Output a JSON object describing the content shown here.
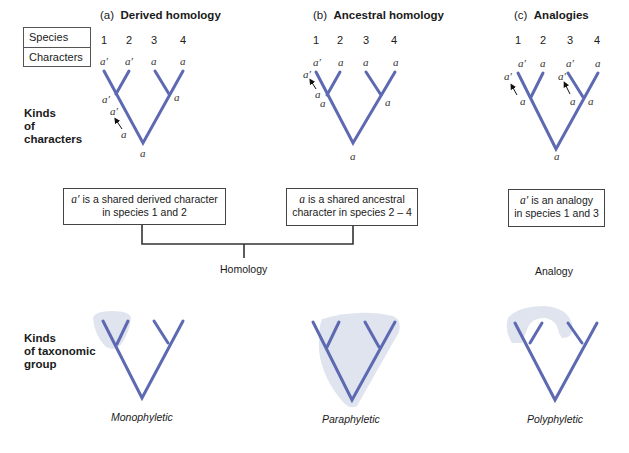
{
  "legend": {
    "species_label": "Species",
    "characters_label": "Characters"
  },
  "panels": [
    {
      "letter": "(a)",
      "title": "Derived homology",
      "species": [
        "1",
        "2",
        "3",
        "4"
      ],
      "leaf_chars": [
        "a′",
        "a′",
        "a",
        "a"
      ],
      "node_labels": {
        "left_node": "a′",
        "branch_upper": "a′",
        "branch_lower": "a",
        "right_node": "a",
        "root": "a"
      }
    },
    {
      "letter": "(b)",
      "title": "Ancestral homology",
      "species": [
        "1",
        "2",
        "3",
        "4"
      ],
      "leaf_chars": [
        "a′",
        "a",
        "a",
        "a"
      ],
      "node_labels": {
        "branch_upper": "a′",
        "branch_lower": "a",
        "left_node": "a",
        "right_node": "a",
        "root": "a"
      }
    },
    {
      "letter": "(c)",
      "title": "Analogies",
      "species": [
        "1",
        "2",
        "3",
        "4"
      ],
      "leaf_chars": [
        "a′",
        "a",
        "a′",
        "a"
      ],
      "node_labels": {
        "branch1_upper": "a′",
        "branch1_lower": "a",
        "branch3_upper": "a′",
        "branch3_lower": "a",
        "right_node": "a",
        "root": "a"
      }
    }
  ],
  "row_labels": {
    "characters": [
      "Kinds",
      "of",
      "characters"
    ],
    "taxonomic": [
      "Kinds",
      "of taxonomic",
      "group"
    ]
  },
  "boxes": {
    "derived": {
      "symbol": "a′",
      "line1": " is a shared derived character",
      "line2": "in species 1 and 2"
    },
    "ancestral": {
      "symbol": "a",
      "line1": " is a shared ancestral",
      "line2": "character in species 2 – 4"
    },
    "analogy": {
      "symbol": "a′",
      "line1": " is an analogy",
      "line2": "in species 1 and 3"
    }
  },
  "captions": {
    "homology": "Homology",
    "analogy": "Analogy"
  },
  "groups": [
    "Monophyletic",
    "Paraphyletic",
    "Polyphyletic"
  ],
  "colors": {
    "tree": "#5d69b1",
    "shade": "#dfe4ee",
    "text": "#1a1a1a",
    "connector": "#333333"
  }
}
